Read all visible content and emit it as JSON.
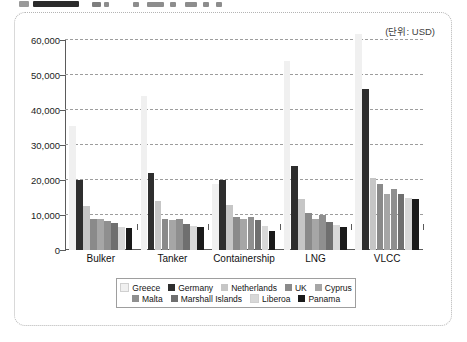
{
  "unit_note": "(단위: USD)",
  "chart_data": {
    "type": "bar",
    "title": "",
    "subtitle": "",
    "xlabel": "",
    "ylabel": "",
    "unit": "USD",
    "ylim": [
      0,
      60000
    ],
    "yticks": [
      0,
      10000,
      20000,
      30000,
      40000,
      50000,
      60000
    ],
    "ytick_labels": [
      "0",
      "10,000",
      "20,000",
      "30,000",
      "40,000",
      "50,000",
      "60,000"
    ],
    "grid": true,
    "legend_position": "bottom",
    "categories": [
      "Bulker",
      "Tanker",
      "Containership",
      "LNG",
      "VLCC"
    ],
    "series": [
      {
        "name": "Greece",
        "color": "#f0f0f0",
        "values": [
          35500,
          44000,
          18800,
          54000,
          62500
        ]
      },
      {
        "name": "Germany",
        "color": "#2e2e2e",
        "values": [
          20000,
          22000,
          20000,
          24000,
          46000
        ]
      },
      {
        "name": "Netherlands",
        "color": "#c6c6c6",
        "values": [
          12700,
          14000,
          13000,
          14500,
          20500
        ]
      },
      {
        "name": "UK",
        "color": "#8a8a8a",
        "values": [
          9000,
          9000,
          9500,
          10500,
          19000
        ]
      },
      {
        "name": "Cyprus",
        "color": "#a6a6a6",
        "values": [
          8800,
          8500,
          9000,
          9000,
          16000
        ]
      },
      {
        "name": "Malta",
        "color": "#8f8f8f",
        "values": [
          8300,
          9000,
          9500,
          10000,
          17500
        ]
      },
      {
        "name": "Marshall Islands",
        "color": "#6f6f6f",
        "values": [
          7800,
          7500,
          8500,
          8000,
          16000
        ]
      },
      {
        "name": "Liberoa",
        "color": "#d8d8d8",
        "values": [
          6600,
          6800,
          7000,
          7200,
          14800
        ]
      },
      {
        "name": "Panama",
        "color": "#1a1a1a",
        "values": [
          6200,
          6500,
          5500,
          6500,
          14500
        ]
      }
    ]
  }
}
